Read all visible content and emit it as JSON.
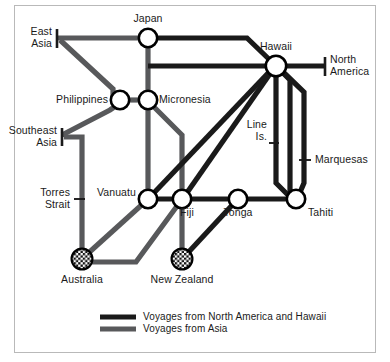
{
  "figure": {
    "kind": "schematic-network-map",
    "frame_border_color": "#b9b9b9",
    "background_color": "#ffffff"
  },
  "colors": {
    "line_america_hawaii": "#1a1a1a",
    "line_asia": "#58595b",
    "node_stroke": "#000000",
    "node_fill": "#ffffff",
    "text": "#1a1a1a"
  },
  "nodes": [
    {
      "id": "japan",
      "label": "Japan",
      "type": "circle",
      "x": 148,
      "y": 38
    },
    {
      "id": "philippines",
      "label": "Philippines",
      "type": "circle",
      "x": 120,
      "y": 100
    },
    {
      "id": "micronesia",
      "label": "Micronesia",
      "type": "circle",
      "x": 148,
      "y": 100
    },
    {
      "id": "hawaii",
      "label": "Hawaii",
      "type": "circle",
      "x": 276,
      "y": 66
    },
    {
      "id": "vanuatu",
      "label": "Vanuatu",
      "type": "circle",
      "x": 148,
      "y": 199
    },
    {
      "id": "fiji",
      "label": "Fiji",
      "type": "circle",
      "x": 182,
      "y": 199
    },
    {
      "id": "tonga",
      "label": "Tonga",
      "type": "circle",
      "x": 238,
      "y": 199
    },
    {
      "id": "tahiti",
      "label": "Tahiti",
      "type": "circle",
      "x": 296,
      "y": 199
    },
    {
      "id": "australia",
      "label": "Australia",
      "type": "checkered",
      "x": 82,
      "y": 259
    },
    {
      "id": "newzealand",
      "label": "New Zealand",
      "type": "checkered",
      "x": 182,
      "y": 259
    }
  ],
  "terminals": [
    {
      "id": "east-asia",
      "label": "East\nAsia",
      "tick": "vertical-bar"
    },
    {
      "id": "southeast-asia",
      "label": "Southeast\nAsia",
      "tick": "vertical-bar"
    },
    {
      "id": "torres-strait",
      "label": "Torres\nStrait",
      "tick": "short-dash"
    },
    {
      "id": "north-america",
      "label": "North\nAmerica",
      "tick": "vertical-bar"
    },
    {
      "id": "line-is",
      "label": "Line\nIs.",
      "tick": "short-dash"
    },
    {
      "id": "marquesas",
      "label": "Marquesas",
      "tick": "short-dash"
    }
  ],
  "labels": {
    "east_asia": "East\nAsia",
    "southeast_asia": "Southeast\nAsia",
    "torres_strait": "Torres\nStrait",
    "north_america": "North\nAmerica",
    "line_is": "Line\nIs.",
    "marquesas": "Marquesas",
    "japan": "Japan",
    "philippines": "Philippines",
    "micronesia": "Micronesia",
    "hawaii": "Hawaii",
    "vanuatu": "Vanuatu",
    "fiji": "Fiji",
    "tonga": "Tonga",
    "tahiti": "Tahiti",
    "australia": "Australia",
    "new_zealand": "New Zealand"
  },
  "legend": {
    "entries": [
      {
        "id": "voyages-north-america-hawaii",
        "label": "Voyages from North America and Hawaii",
        "color": "#1a1a1a"
      },
      {
        "id": "voyages-asia",
        "label": "Voyages from Asia",
        "color": "#58595b"
      }
    ]
  }
}
